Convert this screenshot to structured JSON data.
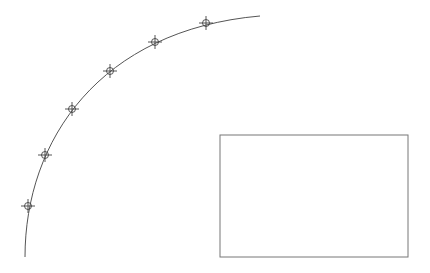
{
  "canvas": {
    "width": 430,
    "height": 273,
    "background": "#ffffff"
  },
  "arc": {
    "stroke": "#555555",
    "path": "M 25 257 C 25 140 100 30 260 16"
  },
  "markers": [
    {
      "x": 28,
      "y": 206
    },
    {
      "x": 45,
      "y": 155
    },
    {
      "x": 72,
      "y": 109
    },
    {
      "x": 110,
      "y": 71
    },
    {
      "x": 155,
      "y": 42
    },
    {
      "x": 206,
      "y": 23
    }
  ],
  "marker_style": {
    "stroke": "#444444",
    "radius": 3.5,
    "arm": 7
  },
  "rectangle": {
    "x": 220,
    "y": 135,
    "width": 188,
    "height": 122,
    "stroke": "#777777"
  }
}
